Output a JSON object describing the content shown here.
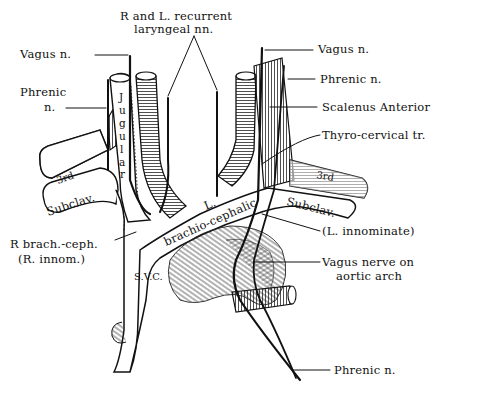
{
  "figure": {
    "background": "#ffffff",
    "ink_color": "#111111"
  },
  "labels": {
    "recurrent_laryngeal_line1": "R and L. recurrent",
    "recurrent_laryngeal_line2": "laryngeal nn.",
    "vagus_left_side": "Vagus n.",
    "phrenic_left_side_line1": "Phrenic",
    "phrenic_left_side_line2": "n.",
    "vagus_right_side": "Vagus n.",
    "phrenic_right_side": "Phrenic n.",
    "scalenus_anterior": "Scalenus Anterior",
    "thyro_cervical": "Thyro-cervical tr.",
    "l_innominate": "(L. innominate)",
    "vagus_aortic_line1": "Vagus nerve on",
    "vagus_aortic_line2": "aortic arch",
    "phrenic_bottom": "Phrenic n.",
    "r_brach_ceph_line1": "R brach.-ceph.",
    "r_brach_ceph_line2": "(R. innom.)",
    "svc": "S.V.C.",
    "jugular": [
      "J",
      "u",
      "g",
      "u",
      "l",
      "a",
      "r"
    ],
    "l_brachio_line1": "L.",
    "l_brachio_line2": "brachio-cephalic",
    "subclav_left": "Subclav.",
    "subclav_right": "Subclav.",
    "third_left": "3rd",
    "third_right": "3rd"
  },
  "icons": {
    "diagram": "anatomical-line-drawing"
  }
}
